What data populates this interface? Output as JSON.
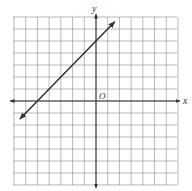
{
  "chart_data": {
    "type": "line",
    "title": "",
    "xlabel": "x",
    "ylabel": "y",
    "origin_label": "O",
    "xlim": [
      -7,
      7
    ],
    "ylim": [
      -7,
      7
    ],
    "grid": true,
    "grid_step": 1,
    "axes_arrows": true,
    "series": [
      {
        "name": "y = x + 5",
        "equation": "y = x + 5",
        "slope": 1,
        "intercept": 5,
        "x": [
          -6.5,
          1.6
        ],
        "y": [
          -1.5,
          6.6
        ],
        "arrows_both_ends": true
      }
    ],
    "x_intercept": -5,
    "y_intercept": 5
  },
  "labels": {
    "x_axis": "x",
    "y_axis": "y",
    "origin": "O"
  },
  "colors": {
    "grid": "#9a9a9a",
    "axis": "#333333",
    "line": "#2a2a2a",
    "background": "#ffffff"
  }
}
